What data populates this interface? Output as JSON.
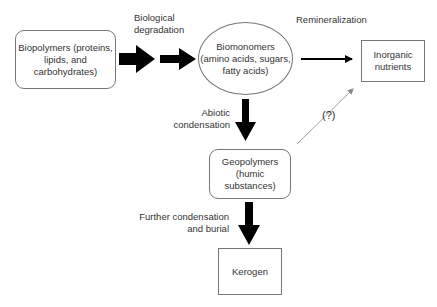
{
  "diagram": {
    "nodes": {
      "biopolymers": {
        "line1": "Biopolymers (proteins,",
        "line2": "lipids, and",
        "line3": "carbohydrates)"
      },
      "biomonomers": {
        "line1": "Biomonomers",
        "line2": "(amino acids, sugars,",
        "line3": "fatty acids)"
      },
      "inorganic": {
        "line1": "Inorganic",
        "line2": "nutrients"
      },
      "geopolymers": {
        "line1": "Geopolymers",
        "line2": "(humic substances)"
      },
      "kerogen": {
        "line1": "Kerogen"
      }
    },
    "edges": {
      "biological_degradation": {
        "line1": "Biological",
        "line2": "degradation"
      },
      "remineralization": {
        "line1": "Remineralization"
      },
      "abiotic_condensation": {
        "line1": "Abiotic",
        "line2": "condensation"
      },
      "uncertain": {
        "line1": "(?)"
      },
      "further_condensation": {
        "line1": "Further condensation",
        "line2": "and burial"
      }
    },
    "colors": {
      "arrow": "#000000",
      "border": "#777777",
      "dotted": "#888888",
      "text": "#333333"
    }
  }
}
